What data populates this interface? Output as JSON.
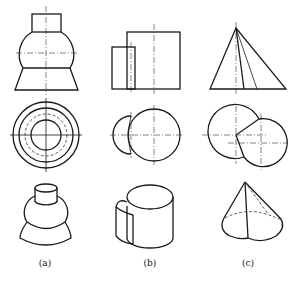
{
  "figure": {
    "type": "orthographic-projection-exercise",
    "columns": [
      {
        "id": "a",
        "label": "(a)",
        "description": "cylinder on sphere on truncated cone"
      },
      {
        "id": "b",
        "label": "(b)",
        "description": "two intersecting cylinders of different diameter"
      },
      {
        "id": "c",
        "label": "(c)",
        "description": "cone merged with half-cone, offset bases"
      }
    ],
    "rows": [
      "front-view",
      "top-view",
      "isometric-view"
    ],
    "colors": {
      "line": "#1a1a1a",
      "background": "#ffffff"
    }
  }
}
